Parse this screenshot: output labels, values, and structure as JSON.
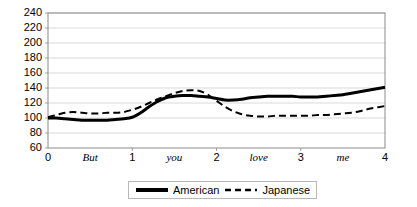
{
  "chart_data": {
    "type": "line",
    "title": "",
    "xlabel": "",
    "ylabel": "",
    "xlim": [
      0,
      4
    ],
    "ylim": [
      60,
      240
    ],
    "y_ticks": [
      240,
      220,
      200,
      180,
      160,
      140,
      120,
      100,
      80,
      60
    ],
    "x_ticks": [
      0,
      1,
      2,
      3,
      4
    ],
    "x_tick_labels": [
      "0",
      "1",
      "2",
      "3",
      "4"
    ],
    "x_word_labels": [
      "But",
      "you",
      "love",
      "me"
    ],
    "x_word_positions": [
      0.5,
      1.5,
      2.5,
      3.5
    ],
    "grid": true,
    "grid_axis": "y",
    "legend_position": "bottom-center",
    "series": [
      {
        "name": "American",
        "style": "solid",
        "color": "#000000",
        "width": 3,
        "x": [
          0.0,
          0.1,
          0.2,
          0.3,
          0.4,
          0.5,
          0.6,
          0.7,
          0.8,
          0.9,
          1.0,
          1.1,
          1.2,
          1.3,
          1.4,
          1.5,
          1.6,
          1.7,
          1.8,
          1.9,
          2.0,
          2.1,
          2.2,
          2.3,
          2.4,
          2.5,
          2.6,
          2.7,
          2.8,
          2.9,
          3.0,
          3.1,
          3.2,
          3.3,
          3.4,
          3.5,
          3.6,
          3.7,
          3.8,
          3.9,
          4.0
        ],
        "values": [
          100,
          100,
          99,
          98,
          97,
          97,
          97,
          97,
          98,
          99,
          101,
          107,
          115,
          122,
          127,
          129,
          130,
          130,
          129,
          128,
          126,
          124,
          124,
          125,
          127,
          128,
          129,
          129,
          129,
          129,
          128,
          128,
          128,
          129,
          130,
          131,
          133,
          135,
          137,
          139,
          141
        ]
      },
      {
        "name": "Japanese",
        "style": "dashed",
        "color": "#000000",
        "width": 2,
        "x": [
          0.0,
          0.1,
          0.2,
          0.3,
          0.4,
          0.5,
          0.6,
          0.7,
          0.8,
          0.9,
          1.0,
          1.1,
          1.2,
          1.3,
          1.4,
          1.5,
          1.6,
          1.7,
          1.8,
          1.9,
          2.0,
          2.1,
          2.2,
          2.3,
          2.4,
          2.5,
          2.6,
          2.7,
          2.8,
          2.9,
          3.0,
          3.1,
          3.2,
          3.3,
          3.4,
          3.5,
          3.6,
          3.7,
          3.8,
          3.9,
          4.0
        ],
        "values": [
          101,
          104,
          107,
          108,
          107,
          106,
          106,
          107,
          107,
          108,
          111,
          115,
          120,
          125,
          129,
          133,
          136,
          137,
          136,
          131,
          123,
          115,
          109,
          105,
          103,
          102,
          102,
          103,
          103,
          103,
          103,
          103,
          104,
          104,
          105,
          106,
          107,
          109,
          112,
          114,
          116
        ]
      }
    ]
  },
  "legend": {
    "items": [
      {
        "label": "American",
        "style": "solid"
      },
      {
        "label": "Japanese",
        "style": "dashed"
      }
    ]
  }
}
